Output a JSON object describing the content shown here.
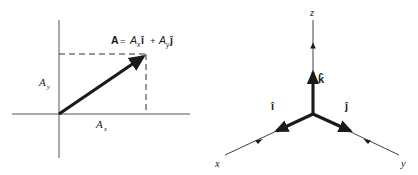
{
  "figure": {
    "background_color": "#ffffff",
    "ink_color": "#1a1a1a"
  },
  "panel_2d": {
    "name": "two-dimensional-vector-decomposition",
    "axes": {
      "x_axis_name": "horizontal-axis",
      "y_axis_name": "vertical-axis"
    },
    "vector": {
      "name": "vector-A",
      "style": "thick-solid-arrow",
      "origin": [
        59,
        114
      ],
      "tip": [
        146,
        55
      ]
    },
    "equation": {
      "full": "A = Axî + Ayĵ",
      "lhs": "A",
      "equals": "=",
      "term1_coeff": "A",
      "term1_sub": "x",
      "term1_unit": "î",
      "plus": "+",
      "term2_coeff": "A",
      "term2_sub": "y",
      "term2_unit": "ĵ"
    },
    "labels": {
      "component_y": "A",
      "component_y_sub": "y",
      "component_x": "A",
      "component_x_sub": "x"
    },
    "guide_lines": {
      "horizontal_dashed_name": "y-component-guide-dashed",
      "vertical_dashed_name": "x-component-guide-dashed",
      "dash_pattern": "6,4"
    }
  },
  "panel_3d": {
    "name": "three-dimensional-unit-vector-axes",
    "origin": [
      104,
      114
    ],
    "axes": [
      {
        "key": "x",
        "label": "x",
        "label_pos": [
          9,
          163
        ],
        "end": [
          16,
          155
        ],
        "tick_arrow": true
      },
      {
        "key": "y",
        "label": "y",
        "label_pos": [
          194,
          164
        ],
        "end": [
          190,
          155
        ],
        "tick_arrow": true
      },
      {
        "key": "z",
        "label": "z",
        "label_pos": [
          104,
          14
        ],
        "end": [
          104,
          20
        ],
        "tick_arrow": true
      }
    ],
    "unit_vectors": [
      {
        "key": "i",
        "label": "î",
        "label_pos": [
          66,
          108
        ],
        "tip": [
          63,
          131
        ],
        "name": "unit-vector-i"
      },
      {
        "key": "j",
        "label": "ĵ",
        "label_pos": [
          139,
          108
        ],
        "tip": [
          146,
          131
        ],
        "name": "unit-vector-j"
      },
      {
        "key": "k",
        "label": "k̂",
        "label_pos": [
          113,
          80
        ],
        "tip": [
          104,
          68
        ],
        "name": "unit-vector-k"
      }
    ]
  }
}
